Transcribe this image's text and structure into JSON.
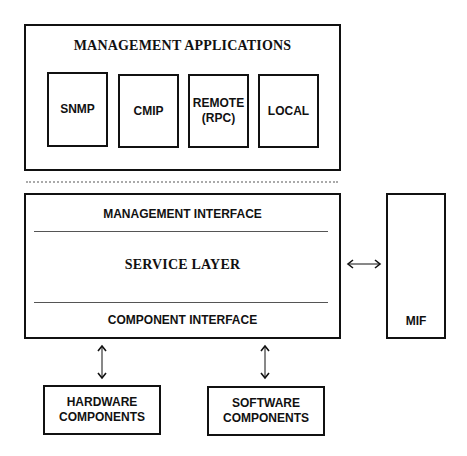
{
  "diagram": {
    "top_group": {
      "title": "MANAGEMENT APPLICATIONS",
      "apps": [
        {
          "label": "SNMP"
        },
        {
          "label": "CMIP"
        },
        {
          "label": "REMOTE\n(RPC)"
        },
        {
          "label": "LOCAL"
        }
      ]
    },
    "service_block": {
      "management_interface": "MANAGEMENT INTERFACE",
      "service_layer": "SERVICE LAYER",
      "component_interface": "COMPONENT INTERFACE"
    },
    "mif": {
      "label": "MIF"
    },
    "components": [
      {
        "label": "HARDWARE\nCOMPONENTS"
      },
      {
        "label": "SOFTWARE\nCOMPONENTS"
      }
    ]
  }
}
